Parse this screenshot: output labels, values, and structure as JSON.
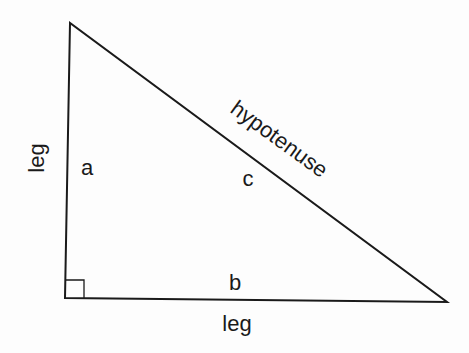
{
  "diagram": {
    "labels": {
      "side_a": "a",
      "side_b": "b",
      "side_c": "c",
      "vertical_leg": "leg",
      "horizontal_leg": "leg",
      "hypotenuse": "hypotenuse"
    },
    "colors": {
      "stroke": "#1a1a1a",
      "background": "#fdfdfd"
    }
  }
}
